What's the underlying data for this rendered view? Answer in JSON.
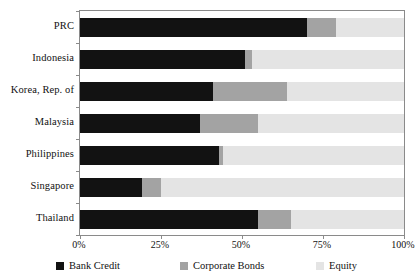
{
  "chart_data": {
    "type": "bar",
    "orientation": "horizontal",
    "stacked": true,
    "normalized": true,
    "title": "",
    "subtitle": "",
    "xlabel": "",
    "ylabel": "",
    "xlim": [
      0,
      100
    ],
    "xticks": [
      0,
      25,
      50,
      75,
      100
    ],
    "xtick_labels": [
      "0%",
      "25%",
      "50%",
      "75%",
      "100%"
    ],
    "grid": false,
    "legend_position": "bottom",
    "categories": [
      "PRC",
      "Indonesia",
      "Korea, Rep. of",
      "Malaysia",
      "Philippines",
      "Singapore",
      "Thailand"
    ],
    "series": [
      {
        "name": "Bank Credit",
        "color": "#121212",
        "values": [
          70,
          51,
          41,
          37,
          43,
          19,
          55
        ]
      },
      {
        "name": "Corporate Bonds",
        "color": "#a3a3a3",
        "values": [
          9,
          2,
          23,
          18,
          1,
          6,
          10
        ]
      },
      {
        "name": "Equity",
        "color": "#e4e4e4",
        "values": [
          21,
          47,
          36,
          45,
          56,
          75,
          35
        ]
      }
    ]
  },
  "axis": {
    "frame_color": "#8a8a8a"
  }
}
